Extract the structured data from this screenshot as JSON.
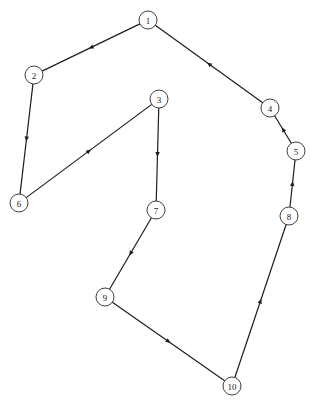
{
  "diagram": {
    "type": "directed-tour-graph",
    "node_radius": 9,
    "colors": {
      "stroke": "#1e1e1e",
      "node_fill": "#ffffff",
      "background": "#ffffff"
    },
    "nodes": [
      {
        "id": "1",
        "label": "1",
        "x": 148,
        "y": 20
      },
      {
        "id": "2",
        "label": "2",
        "x": 34,
        "y": 75
      },
      {
        "id": "3",
        "label": "3",
        "x": 159,
        "y": 99
      },
      {
        "id": "4",
        "label": "4",
        "x": 270,
        "y": 108
      },
      {
        "id": "5",
        "label": "5",
        "x": 296,
        "y": 151
      },
      {
        "id": "6",
        "label": "6",
        "x": 19,
        "y": 203
      },
      {
        "id": "7",
        "label": "7",
        "x": 156,
        "y": 210
      },
      {
        "id": "8",
        "label": "8",
        "x": 289,
        "y": 216
      },
      {
        "id": "9",
        "label": "9",
        "x": 105,
        "y": 297
      },
      {
        "id": "10",
        "label": "10",
        "x": 232,
        "y": 386
      }
    ],
    "edges": [
      {
        "from": "1",
        "to": "2"
      },
      {
        "from": "2",
        "to": "6"
      },
      {
        "from": "6",
        "to": "3"
      },
      {
        "from": "3",
        "to": "7"
      },
      {
        "from": "7",
        "to": "9"
      },
      {
        "from": "9",
        "to": "10"
      },
      {
        "from": "10",
        "to": "8"
      },
      {
        "from": "8",
        "to": "5"
      },
      {
        "from": "5",
        "to": "4"
      },
      {
        "from": "4",
        "to": "1"
      }
    ]
  }
}
